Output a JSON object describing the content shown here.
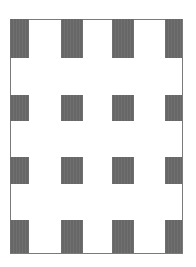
{
  "figure": {
    "frame": {
      "x": 10,
      "y": 19,
      "width": 172,
      "height": 234,
      "color": "#7a7a7a"
    },
    "block_color": "#676767",
    "columns": [
      {
        "x": 10,
        "width": 19
      },
      {
        "x": 61,
        "width": 22
      },
      {
        "x": 112,
        "width": 22
      },
      {
        "x": 165,
        "width": 17
      }
    ],
    "rows": [
      {
        "y": 19,
        "height": 39
      },
      {
        "y": 95,
        "height": 26
      },
      {
        "y": 157,
        "height": 27
      },
      {
        "y": 220,
        "height": 33
      }
    ]
  }
}
